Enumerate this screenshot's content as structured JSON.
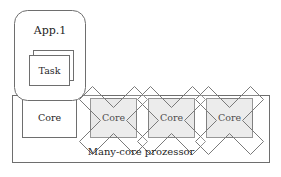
{
  "diagram": {
    "title_label": "Many-core prozessor",
    "app": {
      "label": "App.1",
      "task_label": "Task"
    },
    "cores": [
      {
        "label": "Core",
        "state": "active",
        "crossed": false
      },
      {
        "label": "Core",
        "state": "disabled",
        "crossed": true
      },
      {
        "label": "Core",
        "state": "disabled",
        "crossed": true
      },
      {
        "label": "Core",
        "state": "disabled",
        "crossed": true
      }
    ],
    "colors": {
      "stroke": "#6e6e6e",
      "cross_stroke": "#7a7a7a",
      "shaded_fill": "#e8e8e8",
      "box_fill": "#ffffff",
      "background": "#ffffff",
      "text": "#1f1f1f"
    }
  }
}
